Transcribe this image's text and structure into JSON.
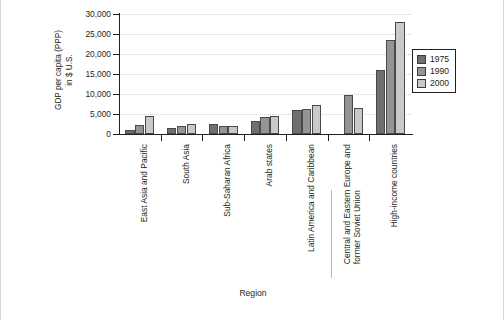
{
  "chart_data": {
    "type": "bar",
    "title": "",
    "xlabel": "Region",
    "ylabel": "GDP per capita (PPP) in $ U.S.",
    "ylabel_line1": "GDP per capita (PPP)",
    "ylabel_line2": "in $ U.S.",
    "ylim": [
      0,
      30000
    ],
    "ytick_values": [
      0,
      5000,
      10000,
      15000,
      20000,
      25000,
      30000
    ],
    "ytick_labels": [
      "0",
      "5,000",
      "10,000",
      "15,000",
      "20,000",
      "25,000",
      "30,000"
    ],
    "grid": true,
    "legend_position": "right",
    "categories": [
      "East Asia and Pacific",
      "South Asia",
      "Sub-Saharan Africa",
      "Arab states",
      "Latin America and Caribbean",
      "Central and Eastern Europe and former Soviet Union",
      "High-income countries"
    ],
    "category_lines": [
      [
        "East Asia and Pacific"
      ],
      [
        "South Asia"
      ],
      [
        "Sub-Saharan Africa"
      ],
      [
        "Arab states"
      ],
      [
        "Latin America and Caribbean"
      ],
      [
        "Central and Eastern Europe and",
        "former Soviet Union"
      ],
      [
        "High-income countries"
      ]
    ],
    "series": [
      {
        "name": "1975",
        "color": "#6e6e6e",
        "values": [
          1000,
          1600,
          2500,
          3300,
          5900,
          null,
          16100
        ]
      },
      {
        "name": "1990",
        "color": "#949494",
        "values": [
          2300,
          1900,
          2100,
          4300,
          6200,
          9700,
          23400
        ]
      },
      {
        "name": "2000",
        "color": "#c9c9c9",
        "values": [
          4500,
          2500,
          2000,
          4600,
          7300,
          6500,
          27900
        ]
      }
    ]
  },
  "legend": {
    "items": [
      {
        "label": "1975",
        "color": "#6e6e6e"
      },
      {
        "label": "1990",
        "color": "#949494"
      },
      {
        "label": "2000",
        "color": "#c9c9c9"
      }
    ]
  },
  "axes": {
    "x_title": "Region",
    "y_title_line1": "GDP per capita (PPP)",
    "y_title_line2": "in $ U.S."
  }
}
